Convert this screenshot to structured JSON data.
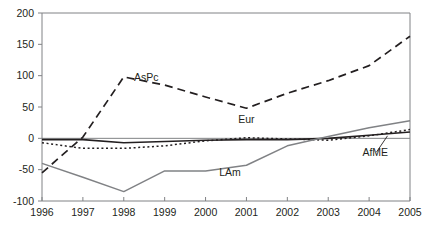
{
  "chart_data": {
    "type": "line",
    "title": "",
    "xlabel": "",
    "ylabel": "",
    "x": [
      1996,
      1997,
      1998,
      1999,
      2000,
      2001,
      2002,
      2003,
      2004,
      2005
    ],
    "categories": [
      "1996",
      "1997",
      "1998",
      "1999",
      "2000",
      "2001",
      "2002",
      "2003",
      "2004",
      "2005"
    ],
    "xlim": [
      1996,
      2005
    ],
    "ylim": [
      -100,
      200
    ],
    "yticks": [
      -100,
      -50,
      0,
      50,
      100,
      150,
      200
    ],
    "ytick_labels": [
      "-100",
      "-50",
      "0",
      "50",
      "100",
      "150",
      "200"
    ],
    "grid": false,
    "legend": "inline-annotations",
    "series": [
      {
        "name": "AsPc",
        "style": "dashed",
        "color": "#231f20",
        "values": [
          -55,
          2,
          98,
          85,
          66,
          48,
          72,
          92,
          116,
          163
        ]
      },
      {
        "name": "Eur",
        "style": "dotted",
        "color": "#231f20",
        "values": [
          -7,
          -16,
          -16,
          -12,
          -4,
          1,
          -1,
          -3,
          4,
          14
        ]
      },
      {
        "name": "AfME",
        "style": "solid",
        "color": "#231f20",
        "values": [
          -2,
          -2,
          -7,
          -5,
          -3,
          -2,
          -2,
          0,
          5,
          10
        ]
      },
      {
        "name": "LAm",
        "style": "solid",
        "color": "#808285",
        "values": [
          -40,
          -62,
          -85,
          -52,
          -52,
          -43,
          -12,
          3,
          17,
          28
        ]
      }
    ],
    "annotations": [
      {
        "text": "AsPc",
        "x": 1998.55,
        "y": 92
      },
      {
        "text": "Eur",
        "x": 2001.0,
        "y": 24
      },
      {
        "text": "LAm",
        "x": 2000.6,
        "y": -60
      },
      {
        "text": "AfME",
        "x": 2004.15,
        "y": -28
      }
    ]
  }
}
